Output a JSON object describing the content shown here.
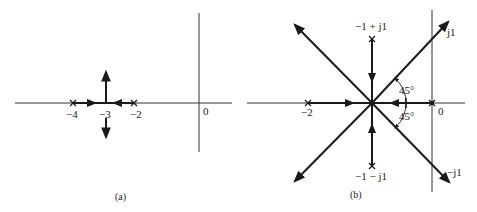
{
  "figure": {
    "panels": [
      {
        "id": "a",
        "caption": "(a)",
        "axis_labels": {
          "origin": "0"
        },
        "real_axis_ticks": [
          "−4",
          "−3",
          "−2"
        ],
        "poles": [
          {
            "label": "−4",
            "re": -4,
            "im": 0
          },
          {
            "label": "−2",
            "re": -2,
            "im": 0
          }
        ],
        "breakaway_point": {
          "label": "−3",
          "re": -3
        },
        "branches": [
          {
            "from": "−4",
            "to": "−3",
            "direction": "right"
          },
          {
            "from": "−2",
            "to": "−3",
            "direction": "left"
          },
          {
            "from": "−3",
            "direction": "up"
          },
          {
            "from": "−3",
            "direction": "down"
          }
        ]
      },
      {
        "id": "b",
        "caption": "(b)",
        "axis_labels": {
          "origin": "0",
          "pos_imag": "j1",
          "neg_imag": "−j1"
        },
        "real_axis_ticks": [
          "−2",
          "0"
        ],
        "poles": [
          {
            "label": "−2",
            "re": -2,
            "im": 0
          },
          {
            "label": "0",
            "re": 0,
            "im": 0
          },
          {
            "label": "−1 + j1",
            "re": -1,
            "im": 1
          },
          {
            "label": "−1 − j1",
            "re": -1,
            "im": -1
          }
        ],
        "centroid": {
          "re": -1,
          "im": 0
        },
        "angle_labels": [
          "45°",
          "45°"
        ],
        "asymptote_angles_deg": [
          45,
          135,
          225,
          315
        ]
      }
    ]
  }
}
